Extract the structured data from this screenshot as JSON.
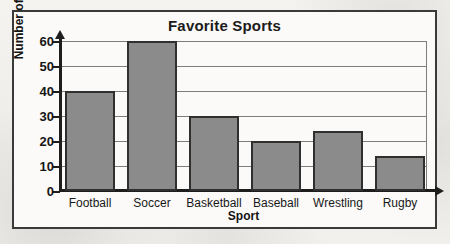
{
  "chart_data": {
    "type": "bar",
    "title": "Favorite Sports",
    "xlabel": "Sport",
    "ylabel": "Number of Students",
    "categories": [
      "Football",
      "Soccer",
      "Basketball",
      "Baseball",
      "Wrestling",
      "Rugby"
    ],
    "values": [
      40,
      60,
      30,
      20,
      24,
      14
    ],
    "ylim": [
      0,
      60
    ],
    "ytick_labels": [
      "60",
      "50",
      "40",
      "30",
      "20",
      "10",
      "0"
    ],
    "ytick_values": [
      60,
      50,
      40,
      30,
      20,
      10,
      0
    ],
    "grid": true,
    "legend": "none",
    "colors": {
      "bar_fill": "#8b8b8b",
      "bar_border": "#2f2f2f",
      "axis": "#1d1d1d",
      "gridline": "#7d7d7d",
      "frame_border": "#3a3a3a",
      "plot_background": "#fbfaf8",
      "page_background": "#f2f1ee",
      "text": "#161616"
    }
  }
}
